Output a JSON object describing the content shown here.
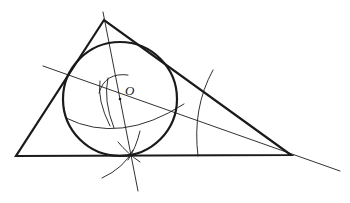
{
  "diagram": {
    "colors": {
      "stroke": "#1a1a1a",
      "background": "#ffffff"
    },
    "labels": {
      "center": "O"
    },
    "triangle": {
      "vertices": {
        "A": [
          104,
          20
        ],
        "B": [
          16,
          156
        ],
        "C": [
          291,
          155
        ]
      }
    },
    "incircle": {
      "center": [
        120,
        99
      ],
      "radius": 57
    },
    "bisector_C": {
      "from": [
        43,
        66
      ],
      "to": [
        340,
        171
      ]
    },
    "perpendicular": {
      "from": [
        103,
        12
      ],
      "to": [
        138,
        191
      ]
    },
    "tangent_point": [
      130,
      155
    ]
  }
}
